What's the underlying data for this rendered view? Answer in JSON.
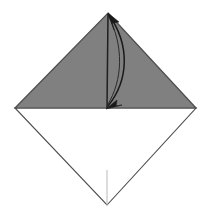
{
  "figure": {
    "type": "origami-diagram",
    "canvas": {
      "width": 211,
      "height": 223
    },
    "background_color": "#ffffff"
  },
  "colors": {
    "paper_shaded": "#808080",
    "paper_unshaded": "#ffffff",
    "edge_stroke": "#4d4d4d",
    "fold_line": "#bfbfbf",
    "arrow_stroke": "#1a1a1a"
  },
  "geometry": {
    "vertices": {
      "top": {
        "x": 108,
        "y": 13
      },
      "left": {
        "x": 15,
        "y": 108
      },
      "right": {
        "x": 196,
        "y": 108
      },
      "bottom": {
        "x": 107,
        "y": 205
      }
    },
    "upper_triangle_points": "108,13 196,108 15,108",
    "lower_triangle_points": "15,108 196,108 107,205"
  },
  "shapes": {
    "upper_triangle": {
      "name": "shaded upper half of folded square",
      "fill": "#808080"
    },
    "lower_triangle": {
      "name": "unshaded lower half of folded square",
      "fill": "#ffffff"
    },
    "center_crease": {
      "name": "vertical centre crease from apex to centre",
      "x1": 108,
      "y1": 14,
      "x2": 107,
      "y2": 108
    },
    "lower_crease": {
      "name": "faint vertical crease in lower white triangle",
      "x1": 107,
      "y1": 170,
      "x2": 107,
      "y2": 205
    }
  },
  "arrow": {
    "name": "curved fold arrow",
    "description": "Curved double-headed arrow bulging right, from apex down to centre point",
    "path": "M 109,15 C 130,45 129,80 108,106",
    "bulge_max_x": 126,
    "heads": [
      {
        "position": "top",
        "direction": "up-left",
        "at": {
          "x": 109,
          "y": 15
        }
      },
      {
        "position": "bottom",
        "direction": "down-left",
        "at": {
          "x": 108,
          "y": 106
        }
      }
    ]
  },
  "labels": {
    "step_number": "",
    "caption": ""
  }
}
